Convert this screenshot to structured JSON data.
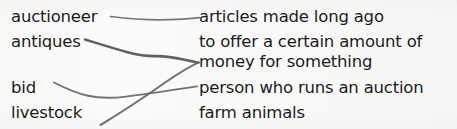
{
  "document": {
    "type": "matching-worksheet",
    "background_color": "#fbfbfa",
    "text_color": "#1b1b1b"
  },
  "terms": [
    {
      "id": "auctioneer",
      "label": "auctioneer"
    },
    {
      "id": "antiques",
      "label": "antiques"
    },
    {
      "id": "bid",
      "label": "bid"
    },
    {
      "id": "livestock",
      "label": "livestock"
    }
  ],
  "definitions": [
    {
      "id": "articles",
      "label": "articles made long ago"
    },
    {
      "id": "offer-1",
      "label": "to offer a certain amount of"
    },
    {
      "id": "offer-2",
      "label": "money for something"
    },
    {
      "id": "person",
      "label": "person who runs an auction"
    },
    {
      "id": "farm",
      "label": "farm animals"
    }
  ],
  "connectors": [
    {
      "id": "auctioneer-to-articles",
      "from": "auctioneer",
      "to": "articles",
      "color": "#6f6f6f",
      "width": 1.7,
      "path": "M 110.5 16.5 C 132 19.2, 158 20.4, 176 19.4 C 187 18.8, 194 18.2, 199.5 17.6"
    },
    {
      "id": "antiques-to-money",
      "from": "antiques",
      "to": "offer-2",
      "color": "#595959",
      "width": 2.6,
      "path": "M 85 39.5 C 98 43.5, 114 48.6, 127.5 52.2 C 137 54.7, 146 56.2, 155.5 56.1 C 166 56.0, 177 58.0, 186 60.0 C 192 61.4, 196 62.2, 198.5 62.6"
    },
    {
      "id": "bid-to-person",
      "from": "bid",
      "to": "person",
      "color": "#6a6a6a",
      "width": 1.9,
      "path": "M 54 82.5 C 64 87.6, 76 93.2, 88 95.8 C 99 98.2, 112 98.4, 126 96.6 C 146 94.0, 170 90.4, 197 86.4"
    },
    {
      "id": "livestock-to-money",
      "from": "livestock",
      "to": "offer-2",
      "color": "#6a6a6a",
      "width": 2.1,
      "path": "M 100.5 125 C 116 115.5, 138 101.5, 158 87.5 C 175 75.5, 189 66.6, 198.5 62.6"
    }
  ]
}
